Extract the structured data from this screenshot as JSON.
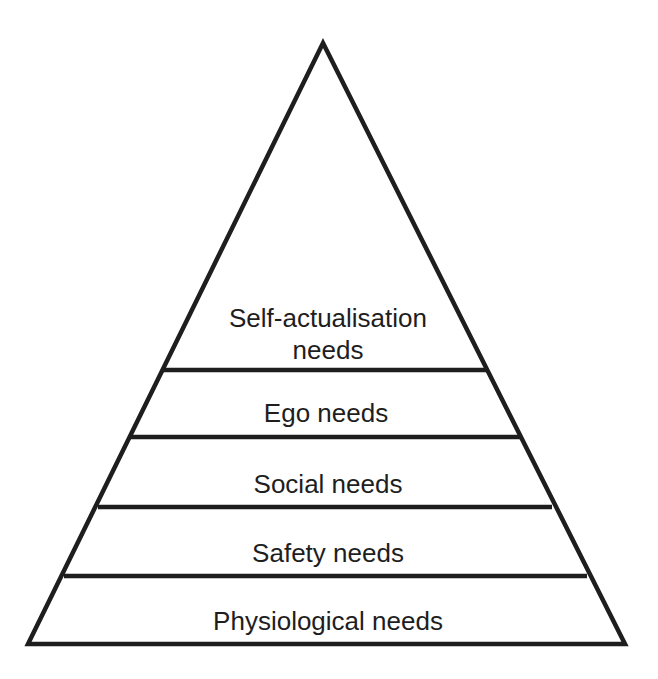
{
  "diagram": {
    "type": "pyramid",
    "stroke_color": "#1e1e1e",
    "background": "#ffffff",
    "levels": [
      {
        "label": "Self-actualisation",
        "label_line2": "needs"
      },
      {
        "label": "Ego needs"
      },
      {
        "label": "Social needs"
      },
      {
        "label": "Safety needs"
      },
      {
        "label": "Physiological needs"
      }
    ]
  }
}
